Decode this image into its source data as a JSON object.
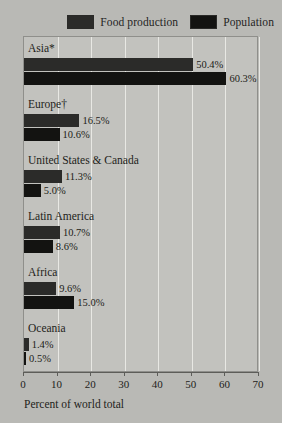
{
  "chart_data": {
    "type": "bar",
    "orientation": "horizontal",
    "title": "",
    "xlabel": "Percent of world total",
    "ylabel": "",
    "xlim": [
      0,
      70
    ],
    "xticks": [
      0,
      10,
      20,
      30,
      40,
      50,
      60,
      70
    ],
    "grid": true,
    "legend_position": "top-right",
    "categories": [
      "Asia*",
      "Europe†",
      "United States & Canada",
      "Latin America",
      "Africa",
      "Oceania"
    ],
    "series": [
      {
        "name": "Food production",
        "color": "#2b2b29",
        "values": [
          50.4,
          16.5,
          11.3,
          10.7,
          9.6,
          1.4
        ],
        "labels": [
          "50.4%",
          "16.5%",
          "11.3%",
          "10.7%",
          "9.6%",
          "1.4%"
        ]
      },
      {
        "name": "Population",
        "color": "#131311",
        "values": [
          60.3,
          10.6,
          5.0,
          8.6,
          15.0,
          0.5
        ],
        "labels": [
          "60.3%",
          "10.6%",
          "5.0%",
          "8.6%",
          "15.0%",
          "0.5%"
        ]
      }
    ]
  },
  "legend": {
    "items": [
      {
        "label": "Food production",
        "color": "#2b2b29"
      },
      {
        "label": "Population",
        "color": "#131311"
      }
    ]
  },
  "axis": {
    "title": "Percent of world total",
    "tick_labels": [
      "0",
      "10",
      "20",
      "30",
      "40",
      "50",
      "60",
      "70"
    ]
  }
}
